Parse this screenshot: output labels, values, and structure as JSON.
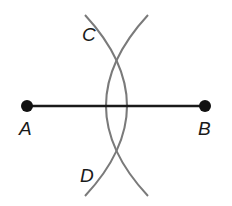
{
  "diagram": {
    "points": [
      {
        "id": "A",
        "label": "A",
        "x": 27,
        "y": 106
      },
      {
        "id": "B",
        "label": "B",
        "x": 205,
        "y": 106
      },
      {
        "id": "C",
        "label": "C",
        "x": 116,
        "y": 35
      },
      {
        "id": "D",
        "label": "D",
        "x": 116,
        "y": 176
      }
    ],
    "segment": {
      "from": "A",
      "to": "B"
    },
    "arcs": [
      {
        "center": "B",
        "description": "arc drawn from B"
      },
      {
        "center": "A",
        "description": "arc drawn from A"
      }
    ],
    "colors": {
      "segment": "#1a1a1a",
      "arc": "#7a7a7a",
      "point": "#111111"
    }
  }
}
